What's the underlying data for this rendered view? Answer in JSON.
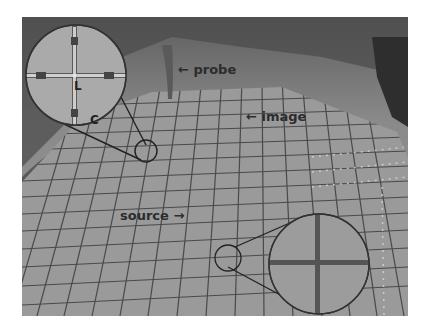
{
  "figure": {
    "annotations": {
      "probe": "probe",
      "image": "image",
      "source": "source"
    },
    "inset_top_left": {
      "labels": {
        "L": "L",
        "C": "C"
      }
    },
    "arrows": {
      "probe_arrow": "←",
      "image_arrow": "←",
      "source_arrow": "→"
    }
  },
  "colors": {
    "background": "#ffffff",
    "photo_base": "#8e8e8e",
    "grid_line": "#3a3a3a",
    "inset_fill": "#a8a8a8",
    "text": "#2c2c2c"
  }
}
